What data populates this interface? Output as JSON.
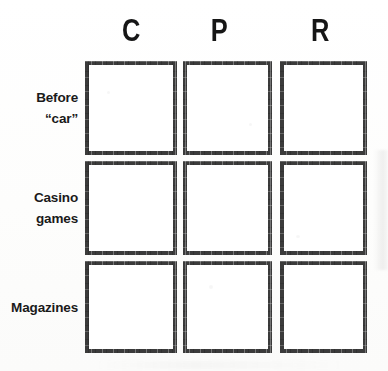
{
  "figure": {
    "type": "blank-response-grid"
  },
  "columns": [
    {
      "label": "C",
      "name": "column-header-c"
    },
    {
      "label": "P",
      "name": "column-header-p"
    },
    {
      "label": "R",
      "name": "column-header-r"
    }
  ],
  "rows": [
    {
      "line1": "Before",
      "line2": "“car”",
      "name": "row-label-before-car"
    },
    {
      "line1": "Casino",
      "line2": "games",
      "name": "row-label-casino-games"
    },
    {
      "line1": "Magazines",
      "line2": "",
      "name": "row-label-magazines"
    }
  ],
  "cells": [
    {
      "row": "Before “car”",
      "column": "C",
      "value": ""
    },
    {
      "row": "Before “car”",
      "column": "P",
      "value": ""
    },
    {
      "row": "Before “car”",
      "column": "R",
      "value": ""
    },
    {
      "row": "Casino games",
      "column": "C",
      "value": ""
    },
    {
      "row": "Casino games",
      "column": "P",
      "value": ""
    },
    {
      "row": "Casino games",
      "column": "R",
      "value": ""
    },
    {
      "row": "Magazines",
      "column": "C",
      "value": ""
    },
    {
      "row": "Magazines",
      "column": "P",
      "value": ""
    },
    {
      "row": "Magazines",
      "column": "R",
      "value": ""
    }
  ],
  "colors": {
    "border": "#3b3b3b",
    "text": "#161616",
    "cell_fill": "#ffffff",
    "page_background": "#fdfdfc"
  }
}
